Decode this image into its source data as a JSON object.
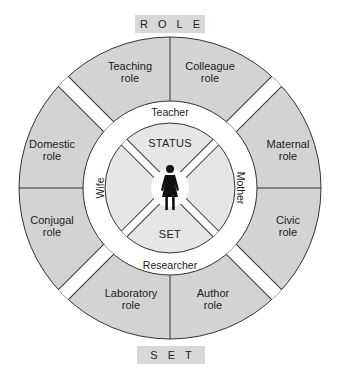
{
  "diagram": {
    "top_title": "ROLE",
    "bottom_title": "SET",
    "core": {
      "top_label": "STATUS",
      "bottom_label": "SET",
      "icon": "female-person-icon"
    },
    "statuses": {
      "top": "Teacher",
      "right": "Mother",
      "bottom": "Researcher",
      "left": "Wife"
    },
    "roles": {
      "top_left": {
        "line1": "Teaching",
        "line2": "role"
      },
      "top_right": {
        "line1": "Colleague",
        "line2": "role"
      },
      "right_top": {
        "line1": "Maternal",
        "line2": "role"
      },
      "right_bottom": {
        "line1": "Civic",
        "line2": "role"
      },
      "bottom_left": {
        "line1": "Laboratory",
        "line2": "role"
      },
      "bottom_right": {
        "line1": "Author",
        "line2": "role"
      },
      "left_top": {
        "line1": "Domestic",
        "line2": "role"
      },
      "left_bottom": {
        "line1": "Conjugal",
        "line2": "role"
      }
    },
    "colors": {
      "outer_segment": "#d3d3d3",
      "inner_segment": "#e6e6e6",
      "title_box": "#d8d8d8",
      "stroke": "#333333"
    }
  }
}
